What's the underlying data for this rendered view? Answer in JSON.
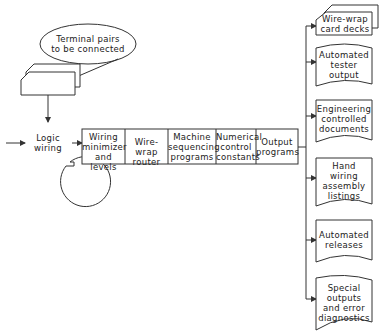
{
  "diagram": {
    "input_ellipse": {
      "label": "Terminal pairs\nto be connected"
    },
    "cards_input": {
      "label": ""
    },
    "logic_wiring": {
      "label": "Logic\nwiring"
    },
    "pipeline": [
      {
        "label": "Wiring\nminimizer\nand levels"
      },
      {
        "label": "Wire-wrap\nrouter"
      },
      {
        "label": "Machine\nsequencing\nprograms"
      },
      {
        "label": "Numerical\ncontrol\nconstants"
      },
      {
        "label": "Output\nprograms"
      }
    ],
    "outputs": [
      {
        "label": "Wire-wrap\ncard decks",
        "shape": "card-deck"
      },
      {
        "label": "Automated\ntester\noutput",
        "shape": "document"
      },
      {
        "label": "Engineering\ncontrolled\ndocuments",
        "shape": "document"
      },
      {
        "label": "Hand\nwiring\nassembly\nlistings",
        "shape": "document"
      },
      {
        "label": "Automated\nreleases",
        "shape": "document"
      },
      {
        "label": "Special\noutputs\nand error\ndiagnostics",
        "shape": "document"
      }
    ],
    "colors": {
      "stroke": "#333333",
      "background": "#ffffff"
    }
  }
}
